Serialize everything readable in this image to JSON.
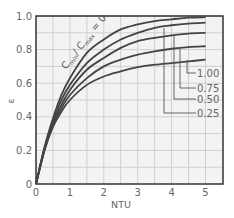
{
  "chart_data": {
    "type": "line",
    "title": "",
    "xlabel": "NTU",
    "ylabel": "ε",
    "xlim": [
      0,
      5.5
    ],
    "ylim": [
      0,
      1.0
    ],
    "x_ticks": [
      "0",
      "1",
      "2",
      "3",
      "4",
      "5"
    ],
    "y_ticks": [
      "0",
      "0.2",
      "0.4",
      "0.6",
      "0.8",
      "1.0"
    ],
    "grid": {
      "x_step": 0.5,
      "y_step": 0.1,
      "on": true
    },
    "legend": "inline leader-line labels at right",
    "annotation": {
      "text_main": "C",
      "sub1": "min",
      "slash": "/ C",
      "sub2": "max",
      "eq": " = 0"
    },
    "x": [
      0,
      0.25,
      0.5,
      0.75,
      1.0,
      1.5,
      2.0,
      2.5,
      3.0,
      3.5,
      4.0,
      4.5,
      5.0
    ],
    "series": [
      {
        "name": "Cmin/Cmax = 0",
        "values": [
          0,
          0.22,
          0.39,
          0.53,
          0.63,
          0.78,
          0.86,
          0.92,
          0.95,
          0.97,
          0.98,
          0.99,
          0.993
        ]
      },
      {
        "name": "Cmin/Cmax = 0.25",
        "values": [
          0,
          0.21,
          0.37,
          0.5,
          0.59,
          0.72,
          0.8,
          0.86,
          0.9,
          0.93,
          0.945,
          0.955,
          0.96
        ]
      },
      {
        "name": "Cmin/Cmax = 0.50",
        "values": [
          0,
          0.21,
          0.36,
          0.47,
          0.56,
          0.68,
          0.75,
          0.81,
          0.85,
          0.87,
          0.885,
          0.895,
          0.9
        ]
      },
      {
        "name": "Cmin/Cmax = 0.75",
        "values": [
          0,
          0.2,
          0.35,
          0.45,
          0.53,
          0.63,
          0.7,
          0.74,
          0.77,
          0.79,
          0.805,
          0.815,
          0.82
        ]
      },
      {
        "name": "Cmin/Cmax = 1.00",
        "values": [
          0,
          0.2,
          0.34,
          0.43,
          0.5,
          0.59,
          0.64,
          0.67,
          0.695,
          0.71,
          0.72,
          0.73,
          0.74
        ]
      }
    ],
    "curve_labels": [
      "1.00",
      "0.75",
      "0.50",
      "0.25"
    ]
  }
}
